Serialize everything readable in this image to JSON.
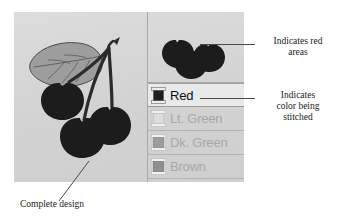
{
  "figure": {
    "kind": "embroidery-software-illustration",
    "panel_background": "#d4d4d4"
  },
  "design": {
    "name": "cherries-design",
    "description": "Complete design: three cherries with stems and a leaf",
    "cherry_color": "#1c1c1c",
    "leaf_color": "#9a9a9a",
    "stem_color": "#2b2b2b",
    "cherry_count": 3
  },
  "preview": {
    "name": "red-areas-preview",
    "description": "Only the red (cherry) areas of the design",
    "blob_color": "#1c1c1c",
    "blob_count": 3
  },
  "color_list": {
    "rows": [
      {
        "label": "Red",
        "selected": true,
        "swatch": "#1e1e1e",
        "spool_body": "#1e1e1e"
      },
      {
        "label": "Lt. Green",
        "selected": false,
        "swatch": "#d9d9d9",
        "spool_body": "#dcdcdc"
      },
      {
        "label": "Dk. Green",
        "selected": false,
        "swatch": "#9c9c9c",
        "spool_body": "#9c9c9c"
      },
      {
        "label": "Brown",
        "selected": false,
        "swatch": "#8f8f8f",
        "spool_body": "#8f8f8f"
      }
    ]
  },
  "annotations": {
    "red_areas": "Indicates red\nareas",
    "color_being_stitched": "Indicates\ncolor being\nstitched",
    "complete_design": "Complete design"
  }
}
